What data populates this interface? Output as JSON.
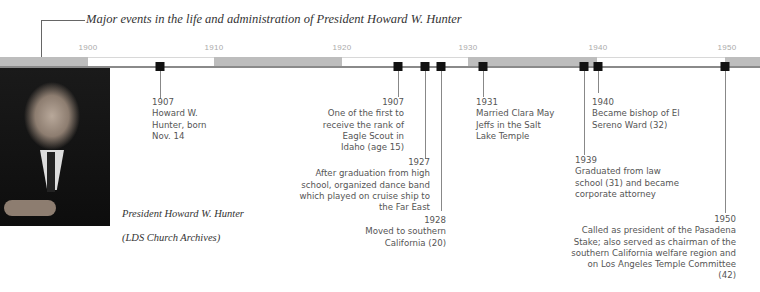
{
  "title": "Major events in the life and administration of President Howard W. Hunter",
  "timeline": {
    "year_labels": [
      "1900",
      "1910",
      "1920",
      "1930",
      "1940",
      "1950"
    ],
    "colors": {
      "gray_segment": "#bdbdbd",
      "white_segment": "#ffffff",
      "marker": "#111111",
      "baseline": "#8a8a8a"
    }
  },
  "photo": {
    "caption_line1": "President Howard W. Hunter",
    "caption_line2": "(LDS Church Archives)"
  },
  "events": [
    {
      "year": "1907",
      "text": "Howard W. Hunter, born Nov. 14"
    },
    {
      "year": "1925",
      "text": "One of the first to receive the rank of Eagle Scout in Idaho (age 15)"
    },
    {
      "year": "1927",
      "text": "After graduation from high school, organized dance band which played on cruise ship to the Far East"
    },
    {
      "year": "1928",
      "text": "Moved to southern California (20)"
    },
    {
      "year": "1931",
      "text": "Married Clara May Jeffs in the Salt Lake Temple"
    },
    {
      "year": "1939",
      "text": "Graduated from law school (31) and became corporate attorney"
    },
    {
      "year": "1940",
      "text": "Became bishop of El Sereno Ward (32)"
    },
    {
      "year": "1950",
      "text": "Called as president of the Pasadena Stake; also served as chairman of the southern California welfare region and on Los Angeles Temple Committee (42)"
    }
  ]
}
